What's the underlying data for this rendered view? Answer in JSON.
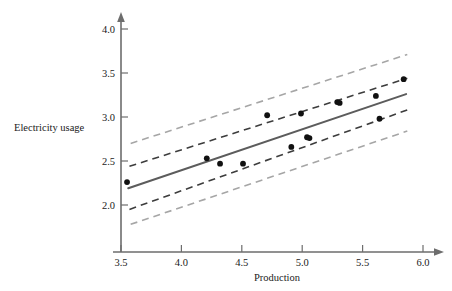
{
  "chart_data": {
    "type": "scatter",
    "title": "",
    "xlabel": "Production",
    "ylabel": "Electricity usage",
    "xlim": [
      3.37,
      6.12
    ],
    "ylim": [
      1.73,
      4.12
    ],
    "grid": false,
    "legend": null,
    "xticks": [
      "3.5",
      "4.0",
      "4.5",
      "5.0",
      "5.5",
      "6.0"
    ],
    "xtick_values": [
      3.5,
      4.0,
      4.5,
      5.0,
      5.5,
      6.0
    ],
    "yticks": [
      "2.0",
      "2.5",
      "3.0",
      "3.5",
      "4.0"
    ],
    "ytick_values": [
      2.0,
      2.5,
      3.0,
      3.5,
      4.0
    ],
    "points": [
      {
        "x": 3.55,
        "y": 2.26
      },
      {
        "x": 4.21,
        "y": 2.53
      },
      {
        "x": 4.32,
        "y": 2.47
      },
      {
        "x": 4.51,
        "y": 2.47
      },
      {
        "x": 4.71,
        "y": 3.02
      },
      {
        "x": 4.91,
        "y": 2.66
      },
      {
        "x": 4.99,
        "y": 3.04
      },
      {
        "x": 5.04,
        "y": 2.77
      },
      {
        "x": 5.06,
        "y": 2.76
      },
      {
        "x": 5.29,
        "y": 3.17
      },
      {
        "x": 5.31,
        "y": 3.16
      },
      {
        "x": 5.61,
        "y": 3.24
      },
      {
        "x": 5.64,
        "y": 2.98
      },
      {
        "x": 5.84,
        "y": 3.43
      }
    ],
    "fit_line": {
      "name": "least-squares fit",
      "x": [
        3.56,
        5.86
      ],
      "y": [
        2.19,
        3.26
      ],
      "color": "#5c5c5c",
      "style": "solid"
    },
    "bands": [
      {
        "name": "confidence-band-upper",
        "x": [
          3.57,
          5.87
        ],
        "y": [
          2.44,
          3.44
        ],
        "color": "#3d3d3d",
        "style": "dashed"
      },
      {
        "name": "confidence-band-lower",
        "x": [
          3.57,
          5.87
        ],
        "y": [
          1.95,
          3.08
        ],
        "color": "#3d3d3d",
        "style": "dashed"
      },
      {
        "name": "prediction-band-upper",
        "x": [
          3.58,
          5.87
        ],
        "y": [
          2.7,
          3.71
        ],
        "color": "#a6a6a6",
        "style": "dashed"
      },
      {
        "name": "prediction-band-lower",
        "x": [
          3.58,
          5.87
        ],
        "y": [
          1.78,
          2.84
        ],
        "color": "#a6a6a6",
        "style": "dashed"
      }
    ],
    "colors": {
      "axis": "#6d6d6d",
      "point": "#111111",
      "fit": "#5c5c5c",
      "band_inner": "#3d3d3d",
      "band_outer": "#a6a6a6",
      "background": "#ffffff"
    }
  }
}
